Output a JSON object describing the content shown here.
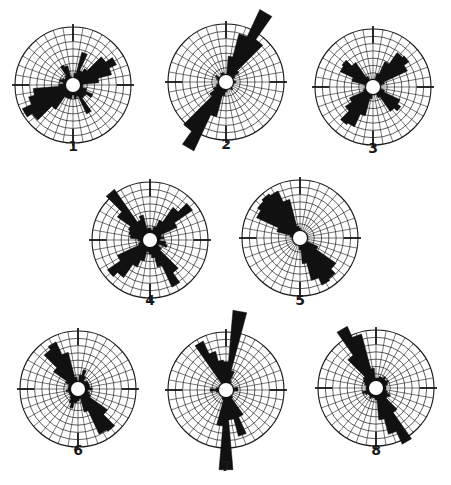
{
  "figure": {
    "type": "rose-diagram-set",
    "colors": {
      "fill": "#111111",
      "grid": "#1a1a1a",
      "background": "#ffffff"
    },
    "grid": {
      "rings": 7,
      "spokes": 36,
      "radius": 58,
      "hole_radius": 7
    },
    "roses": [
      {
        "label": "1",
        "cx": 73,
        "cy": 85,
        "label_y": 146,
        "petals": [
          [
            0,
            6
          ],
          [
            10,
            12
          ],
          [
            20,
            34
          ],
          [
            30,
            16
          ],
          [
            40,
            20
          ],
          [
            50,
            40
          ],
          [
            60,
            48
          ],
          [
            70,
            40
          ],
          [
            80,
            26
          ],
          [
            90,
            10
          ],
          [
            100,
            10
          ],
          [
            110,
            14
          ],
          [
            120,
            22
          ],
          [
            130,
            16
          ],
          [
            140,
            16
          ],
          [
            150,
            32
          ],
          [
            160,
            12
          ],
          [
            170,
            14
          ],
          [
            180,
            10
          ],
          [
            190,
            14
          ],
          [
            200,
            14
          ],
          [
            210,
            14
          ],
          [
            220,
            30
          ],
          [
            230,
            50
          ],
          [
            240,
            56
          ],
          [
            250,
            46
          ],
          [
            260,
            40
          ],
          [
            270,
            14
          ],
          [
            280,
            10
          ],
          [
            290,
            14
          ],
          [
            300,
            12
          ],
          [
            310,
            10
          ],
          [
            320,
            12
          ],
          [
            330,
            22
          ],
          [
            340,
            20
          ],
          [
            350,
            8
          ]
        ]
      },
      {
        "label": "2",
        "cx": 226,
        "cy": 82,
        "label_y": 144,
        "petals": [
          [
            0,
            8
          ],
          [
            10,
            26
          ],
          [
            20,
            50
          ],
          [
            30,
            80
          ],
          [
            40,
            52
          ],
          [
            50,
            16
          ],
          [
            60,
            10
          ],
          [
            70,
            8
          ],
          [
            80,
            8
          ],
          [
            90,
            10
          ],
          [
            100,
            8
          ],
          [
            110,
            8
          ],
          [
            120,
            8
          ],
          [
            130,
            8
          ],
          [
            140,
            10
          ],
          [
            150,
            8
          ],
          [
            160,
            8
          ],
          [
            170,
            8
          ],
          [
            180,
            10
          ],
          [
            190,
            14
          ],
          [
            200,
            36
          ],
          [
            210,
            76
          ],
          [
            220,
            60
          ],
          [
            230,
            20
          ],
          [
            240,
            14
          ],
          [
            250,
            10
          ],
          [
            260,
            8
          ],
          [
            270,
            8
          ],
          [
            280,
            8
          ],
          [
            290,
            10
          ],
          [
            300,
            12
          ],
          [
            310,
            8
          ],
          [
            320,
            8
          ],
          [
            330,
            10
          ],
          [
            340,
            10
          ],
          [
            350,
            8
          ]
        ]
      },
      {
        "label": "3",
        "cx": 373,
        "cy": 87,
        "label_y": 148,
        "petals": [
          [
            0,
            8
          ],
          [
            10,
            8
          ],
          [
            20,
            14
          ],
          [
            30,
            28
          ],
          [
            40,
            42
          ],
          [
            50,
            44
          ],
          [
            60,
            38
          ],
          [
            70,
            12
          ],
          [
            80,
            8
          ],
          [
            90,
            8
          ],
          [
            100,
            8
          ],
          [
            110,
            12
          ],
          [
            120,
            30
          ],
          [
            130,
            34
          ],
          [
            140,
            30
          ],
          [
            150,
            12
          ],
          [
            160,
            8
          ],
          [
            170,
            8
          ],
          [
            180,
            8
          ],
          [
            190,
            12
          ],
          [
            200,
            30
          ],
          [
            210,
            44
          ],
          [
            220,
            46
          ],
          [
            230,
            34
          ],
          [
            240,
            26
          ],
          [
            250,
            10
          ],
          [
            260,
            8
          ],
          [
            270,
            8
          ],
          [
            280,
            8
          ],
          [
            290,
            22
          ],
          [
            300,
            36
          ],
          [
            310,
            38
          ],
          [
            320,
            30
          ],
          [
            330,
            12
          ],
          [
            340,
            8
          ],
          [
            350,
            8
          ]
        ]
      },
      {
        "label": "4",
        "cx": 150,
        "cy": 240,
        "label_y": 300,
        "petals": [
          [
            0,
            12
          ],
          [
            10,
            10
          ],
          [
            20,
            14
          ],
          [
            30,
            22
          ],
          [
            40,
            40
          ],
          [
            50,
            52
          ],
          [
            60,
            30
          ],
          [
            70,
            12
          ],
          [
            80,
            14
          ],
          [
            90,
            10
          ],
          [
            100,
            16
          ],
          [
            110,
            18
          ],
          [
            120,
            10
          ],
          [
            130,
            14
          ],
          [
            140,
            40
          ],
          [
            150,
            52
          ],
          [
            160,
            28
          ],
          [
            170,
            18
          ],
          [
            180,
            14
          ],
          [
            190,
            12
          ],
          [
            200,
            22
          ],
          [
            210,
            30
          ],
          [
            220,
            46
          ],
          [
            230,
            52
          ],
          [
            240,
            36
          ],
          [
            250,
            12
          ],
          [
            260,
            10
          ],
          [
            270,
            12
          ],
          [
            280,
            20
          ],
          [
            290,
            22
          ],
          [
            300,
            24
          ],
          [
            310,
            40
          ],
          [
            320,
            62
          ],
          [
            330,
            22
          ],
          [
            340,
            26
          ],
          [
            350,
            12
          ]
        ]
      },
      {
        "label": "5",
        "cx": 300,
        "cy": 238,
        "label_y": 300,
        "petals": [
          [
            0,
            10
          ],
          [
            10,
            8
          ],
          [
            20,
            8
          ],
          [
            30,
            8
          ],
          [
            40,
            8
          ],
          [
            50,
            8
          ],
          [
            60,
            8
          ],
          [
            70,
            8
          ],
          [
            80,
            8
          ],
          [
            90,
            8
          ],
          [
            100,
            8
          ],
          [
            110,
            8
          ],
          [
            120,
            20
          ],
          [
            130,
            44
          ],
          [
            140,
            50
          ],
          [
            150,
            52
          ],
          [
            160,
            44
          ],
          [
            170,
            26
          ],
          [
            180,
            12
          ],
          [
            190,
            8
          ],
          [
            200,
            8
          ],
          [
            210,
            8
          ],
          [
            220,
            8
          ],
          [
            230,
            8
          ],
          [
            240,
            8
          ],
          [
            250,
            8
          ],
          [
            260,
            8
          ],
          [
            270,
            8
          ],
          [
            280,
            10
          ],
          [
            290,
            24
          ],
          [
            300,
            48
          ],
          [
            310,
            52
          ],
          [
            320,
            54
          ],
          [
            330,
            52
          ],
          [
            340,
            40
          ],
          [
            350,
            12
          ]
        ]
      },
      {
        "label": "6",
        "cx": 78,
        "cy": 389,
        "label_y": 450,
        "petals": [
          [
            0,
            8
          ],
          [
            10,
            14
          ],
          [
            20,
            20
          ],
          [
            30,
            14
          ],
          [
            40,
            10
          ],
          [
            50,
            12
          ],
          [
            60,
            12
          ],
          [
            70,
            12
          ],
          [
            80,
            12
          ],
          [
            90,
            14
          ],
          [
            100,
            10
          ],
          [
            110,
            12
          ],
          [
            120,
            14
          ],
          [
            130,
            36
          ],
          [
            140,
            52
          ],
          [
            150,
            50
          ],
          [
            160,
            24
          ],
          [
            170,
            10
          ],
          [
            180,
            12
          ],
          [
            190,
            14
          ],
          [
            200,
            20
          ],
          [
            210,
            16
          ],
          [
            220,
            12
          ],
          [
            230,
            10
          ],
          [
            240,
            10
          ],
          [
            250,
            10
          ],
          [
            260,
            12
          ],
          [
            270,
            10
          ],
          [
            280,
            10
          ],
          [
            290,
            10
          ],
          [
            300,
            14
          ],
          [
            310,
            30
          ],
          [
            320,
            48
          ],
          [
            330,
            52
          ],
          [
            340,
            38
          ],
          [
            350,
            12
          ]
        ]
      },
      {
        "label": "7",
        "cx": 226,
        "cy": 390,
        "label_y": 466,
        "petals": [
          [
            0,
            28
          ],
          [
            10,
            80
          ],
          [
            20,
            20
          ],
          [
            30,
            10
          ],
          [
            40,
            8
          ],
          [
            50,
            8
          ],
          [
            60,
            8
          ],
          [
            70,
            8
          ],
          [
            80,
            12
          ],
          [
            90,
            12
          ],
          [
            100,
            8
          ],
          [
            110,
            8
          ],
          [
            120,
            8
          ],
          [
            130,
            8
          ],
          [
            140,
            10
          ],
          [
            150,
            30
          ],
          [
            160,
            48
          ],
          [
            170,
            30
          ],
          [
            180,
            80
          ],
          [
            190,
            36
          ],
          [
            200,
            10
          ],
          [
            210,
            8
          ],
          [
            220,
            8
          ],
          [
            230,
            8
          ],
          [
            240,
            8
          ],
          [
            250,
            8
          ],
          [
            260,
            10
          ],
          [
            270,
            16
          ],
          [
            280,
            10
          ],
          [
            290,
            8
          ],
          [
            300,
            8
          ],
          [
            310,
            8
          ],
          [
            320,
            8
          ],
          [
            330,
            54
          ],
          [
            340,
            40
          ],
          [
            350,
            30
          ]
        ]
      },
      {
        "label": "8",
        "cx": 376,
        "cy": 388,
        "label_y": 450,
        "petals": [
          [
            0,
            10
          ],
          [
            10,
            10
          ],
          [
            20,
            12
          ],
          [
            30,
            12
          ],
          [
            40,
            14
          ],
          [
            50,
            12
          ],
          [
            60,
            14
          ],
          [
            70,
            12
          ],
          [
            80,
            10
          ],
          [
            90,
            10
          ],
          [
            100,
            10
          ],
          [
            110,
            12
          ],
          [
            120,
            16
          ],
          [
            130,
            14
          ],
          [
            140,
            30
          ],
          [
            150,
            62
          ],
          [
            160,
            48
          ],
          [
            170,
            32
          ],
          [
            180,
            12
          ],
          [
            190,
            10
          ],
          [
            200,
            10
          ],
          [
            210,
            12
          ],
          [
            220,
            10
          ],
          [
            230,
            10
          ],
          [
            240,
            12
          ],
          [
            250,
            14
          ],
          [
            260,
            10
          ],
          [
            270,
            10
          ],
          [
            280,
            10
          ],
          [
            290,
            12
          ],
          [
            300,
            14
          ],
          [
            310,
            16
          ],
          [
            320,
            40
          ],
          [
            330,
            68
          ],
          [
            340,
            56
          ],
          [
            350,
            20
          ]
        ]
      }
    ]
  },
  "chart_data": {
    "type": "rose",
    "title": "",
    "note": "Eight rose (circular histogram) diagrams on polar grids, 10-degree bins; values are approximate petal lengths in pixels (grid radius = 58).",
    "panels": [
      "1",
      "2",
      "3",
      "4",
      "5",
      "6",
      "7",
      "8"
    ],
    "dominant_orientations_deg": {
      "1": [
        60,
        240
      ],
      "2": [
        30,
        210
      ],
      "3": [
        45,
        135,
        225,
        315
      ],
      "4": [
        50,
        150,
        230,
        320
      ],
      "5": [
        150,
        320
      ],
      "6": [
        145,
        330
      ],
      "7": [
        10,
        180,
        330
      ],
      "8": [
        150,
        330
      ]
    }
  }
}
